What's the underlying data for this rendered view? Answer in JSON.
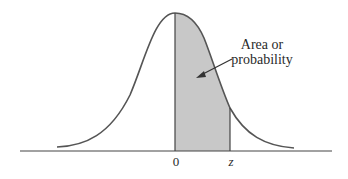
{
  "diagram": {
    "type": "standard-normal-distribution",
    "annotation": {
      "line1": "Area or",
      "line2": "probability"
    },
    "axis_labels": {
      "mean": "0",
      "z": "z"
    },
    "colors": {
      "curve": "#555555",
      "shaded_area": "#c8c8c8",
      "axis": "#444444",
      "text": "#2a2a2a",
      "background": "#ffffff"
    }
  }
}
